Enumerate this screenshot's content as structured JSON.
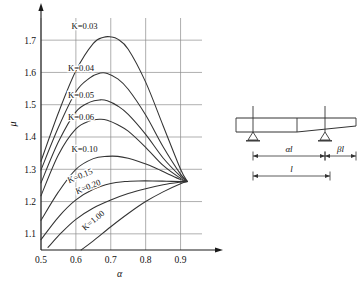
{
  "figure": {
    "background": "#ffffff",
    "line_color": "#333333",
    "grid_color": "#8c8c8c",
    "axis_color": "#1a1a1a"
  },
  "chart_data": {
    "type": "line",
    "title": "",
    "xlabel": "α",
    "ylabel": "μ",
    "xlim": [
      0.5,
      0.95
    ],
    "ylim": [
      1.05,
      1.75
    ],
    "xticks": [
      "0.5",
      "0.6",
      "0.7",
      "0.8",
      "0.9"
    ],
    "xtick_values": [
      0.5,
      0.6,
      0.7,
      0.8,
      0.9
    ],
    "yticks": [
      "1.1",
      "1.2",
      "1.3",
      "1.4",
      "1.5",
      "1.6",
      "1.7"
    ],
    "ytick_values": [
      1.1,
      1.2,
      1.3,
      1.4,
      1.5,
      1.6,
      1.7
    ],
    "grid": true,
    "legend_position": "inline-curve-labels",
    "convergence_point": {
      "x": 0.92,
      "y": 1.262
    },
    "series": [
      {
        "name": "K=0.03",
        "label": "K=0.03",
        "label_pos": {
          "x": 0.625,
          "y": 1.735
        },
        "x": [
          0.5,
          0.55,
          0.6,
          0.65,
          0.68,
          0.7,
          0.72,
          0.75,
          0.8,
          0.85,
          0.9,
          0.92
        ],
        "y": [
          1.325,
          1.475,
          1.605,
          1.69,
          1.709,
          1.71,
          1.703,
          1.672,
          1.57,
          1.435,
          1.3,
          1.262
        ]
      },
      {
        "name": "K=0.04",
        "label": "K=0.04",
        "label_pos": {
          "x": 0.615,
          "y": 1.605
        },
        "x": [
          0.5,
          0.55,
          0.6,
          0.64,
          0.67,
          0.69,
          0.72,
          0.75,
          0.8,
          0.85,
          0.9,
          0.92
        ],
        "y": [
          1.298,
          1.43,
          1.54,
          1.583,
          1.598,
          1.597,
          1.58,
          1.548,
          1.468,
          1.37,
          1.285,
          1.262
        ]
      },
      {
        "name": "K=0.05",
        "label": "K=0.05",
        "label_pos": {
          "x": 0.615,
          "y": 1.522
        },
        "x": [
          0.5,
          0.55,
          0.6,
          0.64,
          0.67,
          0.69,
          0.72,
          0.75,
          0.8,
          0.85,
          0.9,
          0.92
        ],
        "y": [
          1.258,
          1.385,
          1.478,
          1.508,
          1.515,
          1.512,
          1.496,
          1.47,
          1.408,
          1.335,
          1.278,
          1.262
        ]
      },
      {
        "name": "K=0.06",
        "label": "K=0.06",
        "label_pos": {
          "x": 0.615,
          "y": 1.452
        },
        "x": [
          0.5,
          0.55,
          0.6,
          0.64,
          0.67,
          0.69,
          0.72,
          0.75,
          0.8,
          0.85,
          0.9,
          0.92
        ],
        "y": [
          1.218,
          1.345,
          1.425,
          1.45,
          1.455,
          1.452,
          1.438,
          1.418,
          1.368,
          1.312,
          1.272,
          1.262
        ]
      },
      {
        "name": "K=0.10",
        "label": "K=0.10",
        "label_pos": {
          "x": 0.625,
          "y": 1.352
        },
        "x": [
          0.5,
          0.55,
          0.6,
          0.65,
          0.69,
          0.72,
          0.75,
          0.78,
          0.82,
          0.86,
          0.9,
          0.92
        ],
        "y": [
          1.142,
          1.23,
          1.3,
          1.333,
          1.34,
          1.34,
          1.334,
          1.324,
          1.308,
          1.288,
          1.268,
          1.262
        ]
      },
      {
        "name": "K=0.15",
        "label": "K=0.15",
        "label_pos": {
          "x": 0.615,
          "y": 1.272
        },
        "x": [
          0.5,
          0.55,
          0.6,
          0.65,
          0.7,
          0.74,
          0.78,
          0.82,
          0.86,
          0.9,
          0.92
        ],
        "y": [
          1.082,
          1.152,
          1.205,
          1.238,
          1.256,
          1.262,
          1.264,
          1.264,
          1.263,
          1.262,
          1.262
        ]
      },
      {
        "name": "K=0.20",
        "label": "K=0.20",
        "label_pos": {
          "x": 0.638,
          "y": 1.238
        },
        "x": [
          0.52,
          0.56,
          0.6,
          0.65,
          0.7,
          0.75,
          0.8,
          0.85,
          0.9,
          0.92
        ],
        "y": [
          1.058,
          1.105,
          1.145,
          1.18,
          1.205,
          1.225,
          1.24,
          1.252,
          1.26,
          1.262
        ]
      },
      {
        "name": "K=1.00",
        "label": "K=1.00",
        "label_pos": {
          "x": 0.655,
          "y": 1.135
        },
        "x": [
          0.615,
          0.65,
          0.7,
          0.75,
          0.8,
          0.85,
          0.9,
          0.92
        ],
        "y": [
          1.05,
          1.078,
          1.122,
          1.163,
          1.2,
          1.23,
          1.255,
          1.262
        ]
      }
    ]
  },
  "beam_diagram": {
    "name": "tapered-beam-sketch",
    "dimensions": [
      {
        "id": "alpha-l",
        "label": "αl"
      },
      {
        "id": "beta-l",
        "label": "βl"
      },
      {
        "id": "span-l",
        "label": "l"
      }
    ],
    "supports": [
      {
        "id": "support-left",
        "type": "pin"
      },
      {
        "id": "support-right",
        "type": "pin"
      }
    ]
  }
}
